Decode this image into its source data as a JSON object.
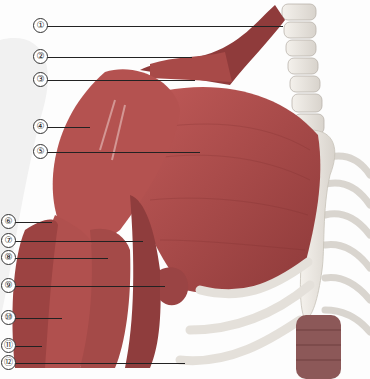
{
  "figure": {
    "colors": {
      "muscle": "#b04a4a",
      "muscle_dark": "#8a3333",
      "bone": "#ece8e2",
      "line": "#222222"
    },
    "labels": [
      {
        "n": "1",
        "text": "①",
        "y": 25,
        "line_end_x": 283
      },
      {
        "n": "2",
        "text": "②",
        "y": 56,
        "line_end_x": 192
      },
      {
        "n": "3",
        "text": "③",
        "y": 79,
        "line_end_x": 195
      },
      {
        "n": "4",
        "text": "④",
        "y": 126,
        "line_end_x": 90
      },
      {
        "n": "5",
        "text": "⑤",
        "y": 151,
        "line_end_x": 200
      },
      {
        "n": "6",
        "text": "⑥",
        "y": 221,
        "line_end_x": 52
      },
      {
        "n": "7",
        "text": "⑦",
        "y": 240,
        "line_end_x": 143
      },
      {
        "n": "8",
        "text": "⑧",
        "y": 257,
        "line_end_x": 108
      },
      {
        "n": "9",
        "text": "⑨",
        "y": 285,
        "line_end_x": 165
      },
      {
        "n": "10",
        "text": "⑩",
        "y": 317,
        "line_end_x": 62
      },
      {
        "n": "11",
        "text": "⑪",
        "y": 345,
        "line_end_x": 42
      },
      {
        "n": "12",
        "text": "⑫",
        "y": 362,
        "line_end_x": 185
      }
    ]
  }
}
